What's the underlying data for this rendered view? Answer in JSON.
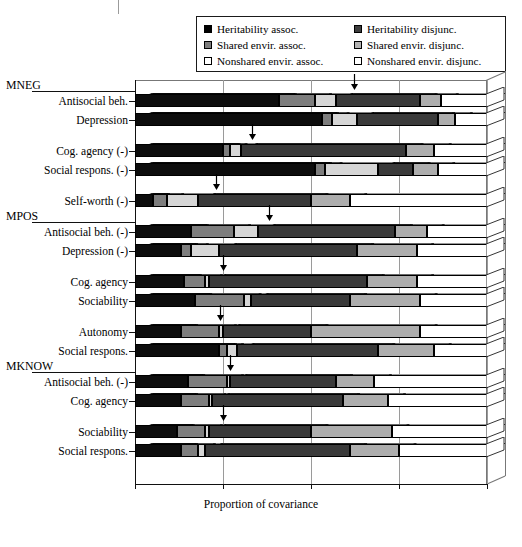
{
  "chart_data": {
    "type": "bar",
    "orientation": "horizontal",
    "stacked": true,
    "title": "",
    "xlabel": "Proportion of covariance",
    "ylabel": "",
    "xlim": [
      0,
      1
    ],
    "xticks": [
      0,
      0.25,
      0.5,
      0.75,
      1
    ],
    "xticklabels": [
      "0",
      "0.25",
      "0.50",
      "0.75",
      "1"
    ],
    "grid": true,
    "legend_position": "top",
    "legend": [
      "Heritability assoc.",
      "Heritability disjunc.",
      "Shared envir. assoc.",
      "Shared envir. disjunc.",
      "Nonshared envir. assoc.",
      "Nonshared envir. disjunc."
    ],
    "series": [
      {
        "name": "Heritability assoc.",
        "key": "her_a",
        "color": "#0d0d0d"
      },
      {
        "name": "Shared envir. assoc.",
        "key": "sha_a",
        "color": "#7d7d7d"
      },
      {
        "name": "Nonshared envir. assoc.",
        "key": "non_a",
        "color": "#d6d6d6"
      },
      {
        "name": "Heritability disjunc.",
        "key": "her_d",
        "color": "#3a3a3a"
      },
      {
        "name": "Shared envir. disjunc.",
        "key": "sha_d",
        "color": "#adadad"
      },
      {
        "name": "Nonshared envir. disjunc.",
        "key": "non_d",
        "color": "#ffffff"
      }
    ],
    "groups": [
      {
        "label": "MNEG",
        "rows": [
          {
            "label": "Antisocial beh.",
            "values": [
              0.41,
              0.1,
              0.06,
              0.24,
              0.06,
              0.13
            ],
            "marker": 0.57
          },
          {
            "label": "Depression",
            "values": [
              0.53,
              0.03,
              0.07,
              0.23,
              0.05,
              0.09
            ],
            "marker": null
          }
        ]
      },
      {
        "label": "",
        "rows": [
          {
            "label": "Cog. agency (-)",
            "values": [
              0.25,
              0.02,
              0.03,
              0.47,
              0.08,
              0.15
            ],
            "marker": 0.28
          },
          {
            "label": "Social respons. (-)",
            "values": [
              0.51,
              0.03,
              0.15,
              0.1,
              0.07,
              0.14
            ],
            "marker": null
          }
        ]
      },
      {
        "label": "",
        "rows": [
          {
            "label": "Self-worth (-)",
            "values": [
              0.05,
              0.04,
              0.09,
              0.32,
              0.11,
              0.39
            ],
            "marker": 0.18
          }
        ]
      },
      {
        "label": "MPOS",
        "rows": [
          {
            "label": "Antisocial beh. (-)",
            "values": [
              0.16,
              0.12,
              0.07,
              0.39,
              0.09,
              0.17
            ],
            "marker": 0.33
          },
          {
            "label": "Depression (-)",
            "values": [
              0.13,
              0.03,
              0.08,
              0.39,
              0.17,
              0.2
            ],
            "marker": null
          }
        ]
      },
      {
        "label": "",
        "rows": [
          {
            "label": "Cog. agency",
            "values": [
              0.14,
              0.06,
              0.01,
              0.45,
              0.14,
              0.2
            ],
            "marker": 0.2
          },
          {
            "label": "Sociability",
            "values": [
              0.17,
              0.14,
              0.02,
              0.28,
              0.2,
              0.19
            ],
            "marker": null
          }
        ]
      },
      {
        "label": "",
        "rows": [
          {
            "label": "Autonomy",
            "values": [
              0.13,
              0.11,
              0.01,
              0.25,
              0.31,
              0.19
            ],
            "marker": 0.19
          },
          {
            "label": "Social respons.",
            "values": [
              0.24,
              0.02,
              0.03,
              0.4,
              0.16,
              0.15
            ],
            "marker": null
          }
        ]
      },
      {
        "label": "MKNOW",
        "rows": [
          {
            "label": "Antisocial beh. (-)",
            "values": [
              0.15,
              0.11,
              0.01,
              0.3,
              0.11,
              0.32
            ],
            "marker": 0.22
          },
          {
            "label": "Cog. agency",
            "values": [
              0.13,
              0.08,
              0.01,
              0.37,
              0.13,
              0.28
            ],
            "marker": null
          }
        ]
      },
      {
        "label": "",
        "rows": [
          {
            "label": "Sociability",
            "values": [
              0.12,
              0.08,
              0.01,
              0.29,
              0.23,
              0.27
            ],
            "marker": 0.2
          },
          {
            "label": "Social respons.",
            "values": [
              0.13,
              0.05,
              0.02,
              0.41,
              0.14,
              0.25
            ],
            "marker": null
          }
        ]
      }
    ]
  }
}
